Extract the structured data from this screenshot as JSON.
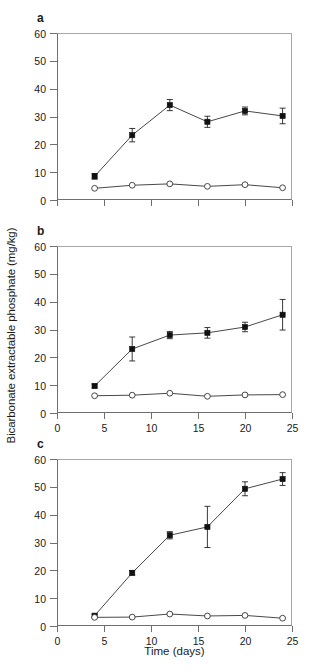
{
  "figure": {
    "xlabel": "Time (days)",
    "ylabel": "Bicarbonate extractable phosphate (mg/kg)",
    "panel_letters": [
      "a",
      "b",
      "c"
    ]
  },
  "chart_data": [
    {
      "type": "line",
      "panel": "a",
      "title": "a",
      "xlabel": "",
      "ylabel": "Bicarbonate extractable phosphate (mg/kg)",
      "xlim": [
        0,
        25
      ],
      "ylim": [
        0,
        60
      ],
      "xticks": [
        0,
        5,
        10,
        15,
        20,
        25
      ],
      "xtick_labels": [
        "",
        "",
        "",
        "",
        "",
        ""
      ],
      "yticks": [
        0,
        10,
        20,
        30,
        40,
        50,
        60
      ],
      "ytick_labels": [
        "0",
        "10",
        "20",
        "30",
        "40",
        "50",
        "60"
      ],
      "grid": false,
      "legend": "none",
      "x": [
        4,
        8,
        12,
        16,
        20,
        24
      ],
      "series": [
        {
          "name": "filled-square",
          "marker": "filled-square",
          "values": [
            8.5,
            23.3,
            34.1,
            28.1,
            32.0,
            30.2
          ],
          "errors": [
            1.0,
            2.4,
            2.0,
            2.0,
            1.4,
            2.8
          ]
        },
        {
          "name": "open-circle",
          "marker": "open-circle",
          "values": [
            4.2,
            5.3,
            5.8,
            4.9,
            5.5,
            4.4
          ],
          "errors": [
            0,
            0,
            0,
            0,
            0,
            0
          ]
        }
      ]
    },
    {
      "type": "line",
      "panel": "b",
      "title": "b",
      "xlabel": "",
      "ylabel": "Bicarbonate extractable phosphate (mg/kg)",
      "xlim": [
        0,
        25
      ],
      "ylim": [
        0,
        60
      ],
      "xticks": [
        0,
        5,
        10,
        15,
        20,
        25
      ],
      "xtick_labels": [
        "0",
        "5",
        "10",
        "15",
        "20",
        "25"
      ],
      "yticks": [
        0,
        10,
        20,
        30,
        40,
        50,
        60
      ],
      "ytick_labels": [
        "0",
        "10",
        "20",
        "30",
        "40",
        "50",
        "60"
      ],
      "grid": false,
      "legend": "none",
      "x": [
        4,
        8,
        12,
        16,
        20,
        24
      ],
      "series": [
        {
          "name": "filled-square",
          "marker": "filled-square",
          "values": [
            9.7,
            23.0,
            28.0,
            28.8,
            30.9,
            35.3
          ],
          "errors": [
            0.7,
            4.3,
            1.3,
            1.9,
            1.7,
            5.5
          ]
        },
        {
          "name": "open-circle",
          "marker": "open-circle",
          "values": [
            6.2,
            6.4,
            7.1,
            6.0,
            6.5,
            6.6
          ],
          "errors": [
            0,
            0,
            0,
            0,
            0,
            0
          ]
        }
      ]
    },
    {
      "type": "line",
      "panel": "c",
      "title": "c",
      "xlabel": "Time (days)",
      "ylabel": "Bicarbonate extractable phosphate (mg/kg)",
      "xlim": [
        0,
        25
      ],
      "ylim": [
        0,
        60
      ],
      "xticks": [
        0,
        5,
        10,
        15,
        20,
        25
      ],
      "xtick_labels": [
        "0",
        "5",
        "10",
        "15",
        "20",
        "25"
      ],
      "yticks": [
        0,
        10,
        20,
        30,
        40,
        50,
        60
      ],
      "ytick_labels": [
        "0",
        "10",
        "20",
        "30",
        "40",
        "50",
        "60"
      ],
      "grid": false,
      "legend": "none",
      "x": [
        4,
        8,
        12,
        16,
        20,
        24
      ],
      "series": [
        {
          "name": "filled-square",
          "marker": "filled-square",
          "values": [
            3.7,
            19.1,
            32.6,
            35.6,
            49.3,
            52.8
          ],
          "errors": [
            0.6,
            0.8,
            1.3,
            7.4,
            2.5,
            2.3
          ]
        },
        {
          "name": "open-circle",
          "marker": "open-circle",
          "values": [
            3.1,
            3.2,
            4.3,
            3.6,
            3.8,
            2.8
          ],
          "errors": [
            0,
            0,
            0,
            0,
            0,
            0
          ]
        }
      ]
    }
  ]
}
